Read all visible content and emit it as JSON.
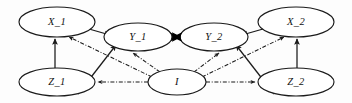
{
  "figure": {
    "type": "path-diagram",
    "title": "",
    "background_color": "#fdfdfd",
    "stroke_color": "#1b1b1b"
  },
  "nodes": [
    {
      "id": "X_1",
      "label": "X_1",
      "cx": 57,
      "cy": 22,
      "rx": 38,
      "ry": 15
    },
    {
      "id": "Y_1",
      "label": "Y_1",
      "cx": 138,
      "cy": 37,
      "rx": 34,
      "ry": 14
    },
    {
      "id": "Y_2",
      "label": "Y_2",
      "cx": 214,
      "cy": 37,
      "rx": 34,
      "ry": 14
    },
    {
      "id": "X_2",
      "label": "X_2",
      "cx": 296,
      "cy": 22,
      "rx": 38,
      "ry": 15
    },
    {
      "id": "Z_1",
      "label": "Z_1",
      "cx": 57,
      "cy": 82,
      "rx": 38,
      "ry": 14
    },
    {
      "id": "I",
      "label": "I",
      "cx": 177,
      "cy": 82,
      "rx": 29,
      "ry": 13
    },
    {
      "id": "Z_2",
      "label": "Z_2",
      "cx": 296,
      "cy": 82,
      "rx": 38,
      "ry": 14
    }
  ],
  "edges": [
    {
      "from": "Z_1",
      "to": "X_1",
      "style": "solid",
      "arrow": "single",
      "note": "Z_1 to X_1 vertical"
    },
    {
      "from": "X_1",
      "to": "Y_1",
      "style": "solid",
      "arrow": "single",
      "note": "X_1 to Y_1"
    },
    {
      "from": "Z_1",
      "to": "Y_1",
      "style": "solid",
      "arrow": "single",
      "note": "Z_1 to Y_1 diagonal"
    },
    {
      "from": "Z_2",
      "to": "X_2",
      "style": "solid",
      "arrow": "single",
      "note": "Z_2 to X_2 vertical"
    },
    {
      "from": "X_2",
      "to": "Y_2",
      "style": "solid",
      "arrow": "single",
      "note": "X_2 to Y_2"
    },
    {
      "from": "Z_2",
      "to": "Y_2",
      "style": "solid",
      "arrow": "single",
      "note": "Z_2 to Y_2 diagonal"
    },
    {
      "from": "Y_1",
      "to": "Y_2",
      "style": "bold",
      "arrow": "double",
      "note": "Y_1 bidirectional Y_2"
    },
    {
      "from": "I",
      "to": "X_1",
      "style": "dashdot",
      "arrow": "single",
      "note": "I to X_1"
    },
    {
      "from": "I",
      "to": "Y_1",
      "style": "dashdot",
      "arrow": "single",
      "note": "I to Y_1"
    },
    {
      "from": "I",
      "to": "Z_1",
      "style": "dashdot",
      "arrow": "single",
      "note": "I to Z_1"
    },
    {
      "from": "I",
      "to": "X_2",
      "style": "dashdot",
      "arrow": "single",
      "note": "I to X_2"
    },
    {
      "from": "I",
      "to": "Y_2",
      "style": "dashdot",
      "arrow": "single",
      "note": "I to Y_2"
    },
    {
      "from": "I",
      "to": "Z_2",
      "style": "dashdot",
      "arrow": "single",
      "note": "I to Z_2"
    }
  ],
  "labels": {
    "x1": "X_1",
    "y1": "Y_1",
    "y2": "Y_2",
    "x2": "X_2",
    "z1": "Z_1",
    "i": "I",
    "z2": "Z_2"
  }
}
